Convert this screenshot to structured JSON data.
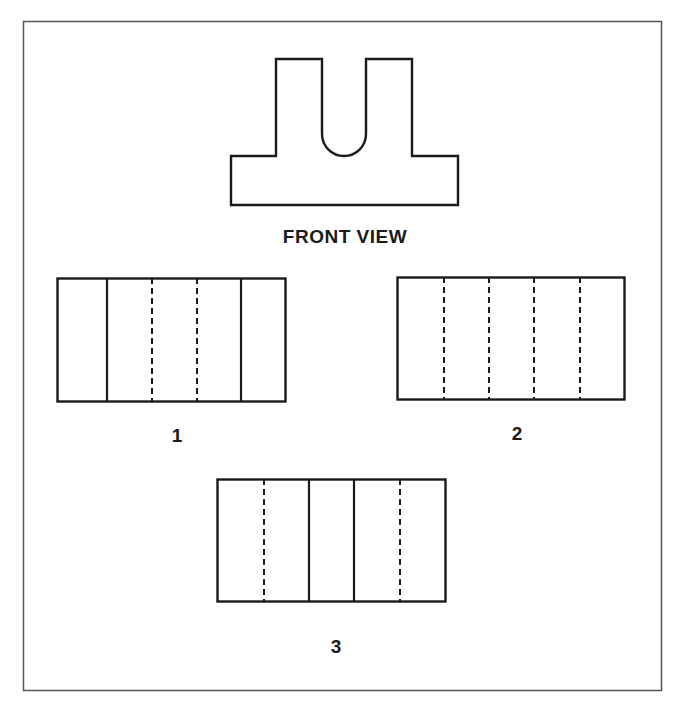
{
  "diagram": {
    "type": "orthographic-projection-question",
    "colors": {
      "line": "#1a1a1a",
      "frame": "#555555",
      "background": "#ffffff"
    },
    "front_view": {
      "label": "FRONT VIEW",
      "shape": "U-slotted block on wide base (two prongs with round-bottom slot)"
    },
    "options": [
      {
        "label": "1",
        "lines": [
          "solid",
          "solid",
          "dashed",
          "dashed",
          "solid"
        ],
        "description": "outer edges + solid, solid, dashed, dashed, solid vertical lines"
      },
      {
        "label": "2",
        "lines": [
          "dashed",
          "dashed",
          "dashed",
          "dashed"
        ],
        "description": "four dashed vertical lines"
      },
      {
        "label": "3",
        "lines": [
          "dashed",
          "solid",
          "solid",
          "dashed"
        ],
        "description": "dashed, solid, solid, dashed vertical lines"
      }
    ]
  }
}
